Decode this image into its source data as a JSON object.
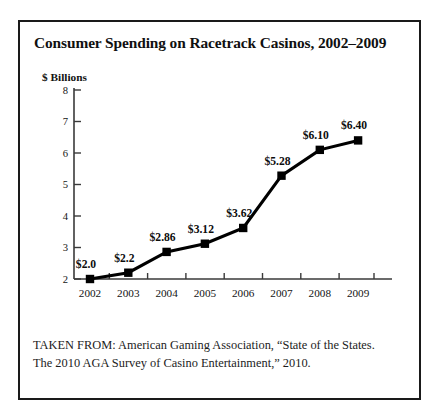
{
  "figure": {
    "title": "Consumer Spending on Racetrack Casinos, 2002–2009",
    "citation_line_1": "TAKEN FROM: American Gaming Association, “State of the States.",
    "citation_line_2": "The 2010 AGA Survey of Casino Entertainment,” 2010.",
    "border_color": "#1a1a1a",
    "background_color": "#ffffff"
  },
  "chart_data": {
    "type": "line",
    "title": "Consumer Spending on Racetrack Casinos, 2002–2009",
    "xlabel": "",
    "ylabel": "$ Billions",
    "categories": [
      "2002",
      "2003",
      "2004",
      "2005",
      "2006",
      "2007",
      "2008",
      "2009"
    ],
    "values": [
      2.0,
      2.2,
      2.86,
      3.12,
      3.62,
      5.28,
      6.1,
      6.4
    ],
    "point_labels": [
      "$2.0",
      "$2.2",
      "$2.86",
      "$3.12",
      "$3.62",
      "$5.28",
      "$6.10",
      "$6.40"
    ],
    "ylim": [
      2,
      8
    ],
    "yticks": [
      2,
      3,
      4,
      5,
      6,
      7,
      8
    ],
    "ytick_labels": [
      "2",
      "3",
      "4",
      "5",
      "6",
      "7",
      "8"
    ],
    "grid": false,
    "legend": null,
    "series_color": "#000000",
    "marker": "square"
  }
}
